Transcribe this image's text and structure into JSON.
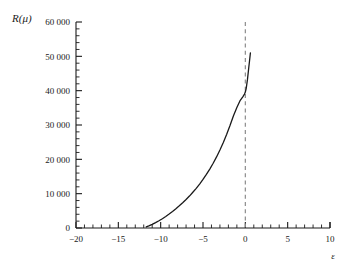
{
  "chart_data": {
    "type": "line",
    "title": "",
    "subtitle": "",
    "xlabel": "ε",
    "ylabel": "R(μ)",
    "xlim": [
      -20,
      10
    ],
    "ylim": [
      0,
      60000
    ],
    "grid": false,
    "legend": null,
    "background_color": "#ffffff",
    "xticks": [
      -20,
      -15,
      -10,
      -5,
      0,
      5,
      10
    ],
    "xtick_labels": [
      "−20",
      "−15",
      "−10",
      "−5",
      "0",
      "5",
      "10"
    ],
    "xtick_minor_step": 1,
    "yticks": [
      0,
      10000,
      20000,
      30000,
      40000,
      50000,
      60000
    ],
    "ytick_labels": [
      "0",
      "10 000",
      "20 000",
      "30 000",
      "40 000",
      "50 000",
      "60 000"
    ],
    "ytick_minor_step": 2000,
    "series": [
      {
        "name": "R(μ)",
        "type": "line",
        "color": "#1a1a1a",
        "linewidth": 1.3,
        "linestyle": "solid",
        "x": [
          -11.7,
          -11.4,
          -11.0,
          -10.6,
          -10.2,
          -9.8,
          -9.4,
          -9.0,
          -8.6,
          -8.2,
          -7.8,
          -7.4,
          -7.0,
          -6.6,
          -6.2,
          -5.8,
          -5.4,
          -5.0,
          -4.6,
          -4.2,
          -3.8,
          -3.4,
          -3.0,
          -2.6,
          -2.2,
          -1.8,
          -1.4,
          -1.0,
          -0.6,
          -0.3,
          -0.1,
          0.0,
          0.1,
          0.25,
          0.4,
          0.5,
          0.6
        ],
        "y": [
          300,
          600,
          1050,
          1550,
          2100,
          2700,
          3350,
          4050,
          4800,
          5600,
          6450,
          7350,
          8300,
          9300,
          10400,
          11550,
          12800,
          14150,
          15600,
          17150,
          18850,
          20700,
          22700,
          24900,
          27300,
          29900,
          32700,
          35100,
          37200,
          38200,
          39000,
          39600,
          40600,
          43200,
          46600,
          48800,
          51000
        ]
      }
    ],
    "annotations": [
      {
        "name": "zero-reference-line",
        "type": "vline",
        "x": 0,
        "color": "#8c8c8c",
        "linestyle": "dashed",
        "linewidth": 1.2,
        "label": ""
      }
    ],
    "spines": {
      "left": true,
      "bottom": true,
      "top": false,
      "right": false
    }
  }
}
